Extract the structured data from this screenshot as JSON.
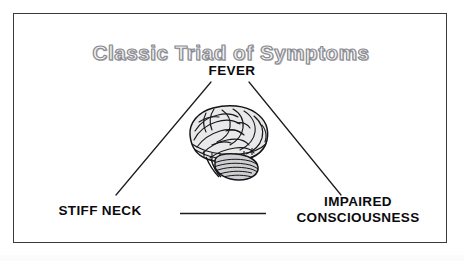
{
  "figure": {
    "title": "Classic Triad of Symptoms",
    "title_color": "#8a8a90",
    "frame_color": "#3a3a42",
    "background_color": "#ffffff",
    "label_color": "#0b0b0d",
    "line_color": "#1b1b20"
  },
  "vertices": {
    "top": {
      "id": "fever",
      "label": "FEVER"
    },
    "bottom_left": {
      "id": "stiff-neck",
      "label": "STIFF NECK"
    },
    "bottom_right": {
      "id": "impaired-consciousness",
      "label_line1": "IMPAIRED",
      "label_line2": "CONSCIOUSNESS"
    }
  },
  "illustration": {
    "name": "brain-illustration",
    "description": "lateral view of human brain"
  },
  "connectors": {
    "left_edge": "fever-to-stiff-neck",
    "right_edge": "fever-to-impaired-consciousness",
    "base_edge": "stiff-neck-to-impaired-consciousness"
  }
}
